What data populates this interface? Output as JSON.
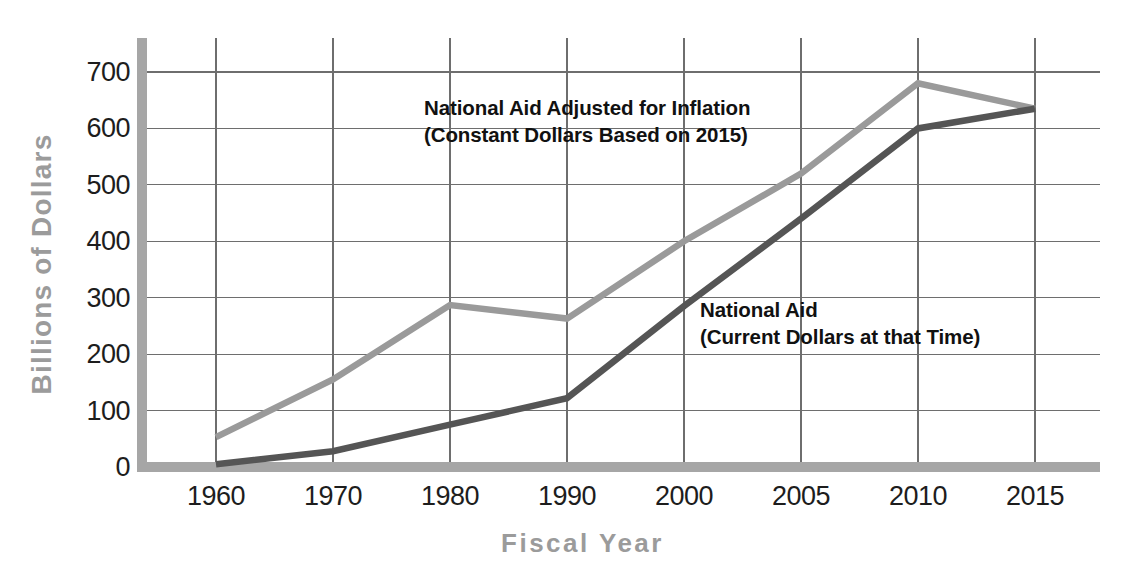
{
  "chart_data": {
    "type": "line",
    "title": "",
    "xlabel": "Fiscal Year",
    "ylabel": "Billions of Dollars",
    "categories": [
      "1960",
      "1970",
      "1980",
      "1990",
      "2000",
      "2005",
      "2010",
      "2015"
    ],
    "ylim": [
      0,
      740
    ],
    "yticks": [
      0,
      100,
      200,
      300,
      400,
      500,
      600,
      700
    ],
    "ytick_labels": [
      "0",
      "100",
      "200",
      "300",
      "400",
      "500",
      "600",
      "700"
    ],
    "grid": true,
    "legend_position": "inline-annotations",
    "series": [
      {
        "name": "National Aid Adjusted for Inflation",
        "sublabel": "(Constant Dollars Based on 2015)",
        "color": "#9a9a9a",
        "values": [
          53,
          155,
          287,
          263,
          400,
          520,
          680,
          635
        ]
      },
      {
        "name": "National Aid",
        "sublabel": "(Current Dollars at that Time)",
        "color": "#555555",
        "values": [
          5,
          28,
          75,
          122,
          285,
          440,
          600,
          635
        ]
      }
    ],
    "annotations": [
      {
        "id": "adjusted",
        "line1": "National Aid Adjusted for Inflation",
        "line2": "(Constant Dollars Based on 2015)"
      },
      {
        "id": "current",
        "line1": "National Aid",
        "line2": "(Current Dollars at that Time)"
      }
    ]
  },
  "colors": {
    "axis_spine": "#a6a6a6",
    "gridline": "#6e6e6e",
    "series_adjusted": "#9a9a9a",
    "series_current": "#555555",
    "axis_title": "#9b9b9b",
    "tick_text": "#1d1d1d",
    "background": "#ffffff"
  },
  "axis": {
    "y_title": "Billions of Dollars",
    "x_title": "Fiscal Year"
  }
}
